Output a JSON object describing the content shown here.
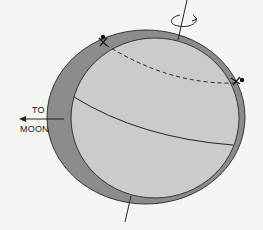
{
  "diagram": {
    "labels": {
      "direction_line1": "TO",
      "direction_line2": "MOON"
    },
    "colors": {
      "background": "#f5f5f3",
      "tidal_envelope": "#8c8c8c",
      "earth": "#cbcbcb",
      "stroke": "#222222"
    },
    "elements": [
      "rotation-axis",
      "rotation-arrow",
      "tidal-envelope",
      "earth-sphere",
      "latitude-line-dashed",
      "equator-line",
      "observer-marker-left",
      "observer-marker-right",
      "moon-direction-arrow"
    ]
  }
}
